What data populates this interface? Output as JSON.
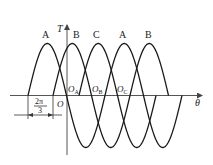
{
  "diagram": {
    "title": "",
    "axes": {
      "x_label": "θ",
      "y_label": "T",
      "origin_label": "O"
    },
    "curves": [
      {
        "label": "A",
        "start_x": 28
      },
      {
        "label": "B",
        "start_x": 53
      },
      {
        "label": "C",
        "start_x": 79
      },
      {
        "label": "A",
        "start_x": 105
      },
      {
        "label": "B",
        "start_x": 130
      }
    ],
    "origins": [
      {
        "main": "O",
        "sub": "A"
      },
      {
        "main": "O",
        "sub": "B"
      },
      {
        "main": "O",
        "sub": "C"
      }
    ],
    "dimension": {
      "numerator": "2π",
      "denominator": "3"
    },
    "colors": {
      "curve": "#1a1a1a",
      "axis": "#555555",
      "background": "#ffffff"
    }
  }
}
